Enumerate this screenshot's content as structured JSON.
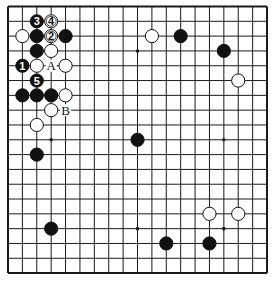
{
  "board": {
    "size": 19,
    "origin": {
      "x": 8,
      "y": 6.5
    },
    "spacing": {
      "x": 14.39,
      "y": 14.81
    },
    "stone_radius": 6.6,
    "colors": {
      "line": "#1a1a1a",
      "black": "#111111",
      "white": "#ffffff",
      "background": "#ffffff"
    },
    "star_points": [
      [
        3,
        3
      ],
      [
        9,
        3
      ],
      [
        15,
        3
      ],
      [
        3,
        9
      ],
      [
        9,
        9
      ],
      [
        15,
        9
      ],
      [
        3,
        15
      ],
      [
        9,
        15
      ],
      [
        15,
        15
      ]
    ],
    "stones": [
      {
        "color": "black",
        "col": 2,
        "row": 1,
        "label": "3"
      },
      {
        "color": "white",
        "col": 3,
        "row": 1,
        "label": "4"
      },
      {
        "color": "white",
        "col": 1,
        "row": 2
      },
      {
        "color": "black",
        "col": 2,
        "row": 2
      },
      {
        "color": "white",
        "col": 3,
        "row": 2,
        "label": "2"
      },
      {
        "color": "black",
        "col": 4,
        "row": 2
      },
      {
        "color": "black",
        "col": 2,
        "row": 3
      },
      {
        "color": "white",
        "col": 3,
        "row": 3
      },
      {
        "color": "black",
        "col": 1,
        "row": 4,
        "label": "1"
      },
      {
        "color": "white",
        "col": 2,
        "row": 4
      },
      {
        "color": "white",
        "col": 4,
        "row": 4
      },
      {
        "color": "black",
        "col": 2,
        "row": 5,
        "label": "5"
      },
      {
        "color": "black",
        "col": 1,
        "row": 6
      },
      {
        "color": "black",
        "col": 2,
        "row": 6
      },
      {
        "color": "black",
        "col": 3,
        "row": 6
      },
      {
        "color": "white",
        "col": 4,
        "row": 6
      },
      {
        "color": "white",
        "col": 3,
        "row": 7
      },
      {
        "color": "white",
        "col": 2,
        "row": 8
      },
      {
        "color": "black",
        "col": 2,
        "row": 10
      },
      {
        "color": "white",
        "col": 10,
        "row": 2
      },
      {
        "color": "black",
        "col": 12,
        "row": 2
      },
      {
        "color": "black",
        "col": 15,
        "row": 3
      },
      {
        "color": "white",
        "col": 16,
        "row": 5
      },
      {
        "color": "black",
        "col": 9,
        "row": 9
      },
      {
        "color": "white",
        "col": 14,
        "row": 14
      },
      {
        "color": "white",
        "col": 16,
        "row": 14
      },
      {
        "color": "black",
        "col": 3,
        "row": 15
      },
      {
        "color": "black",
        "col": 11,
        "row": 16
      },
      {
        "color": "black",
        "col": 14,
        "row": 16
      }
    ],
    "markers": [
      {
        "col": 3,
        "row": 4,
        "text": "A"
      },
      {
        "col": 4,
        "row": 7,
        "text": "B"
      }
    ]
  }
}
